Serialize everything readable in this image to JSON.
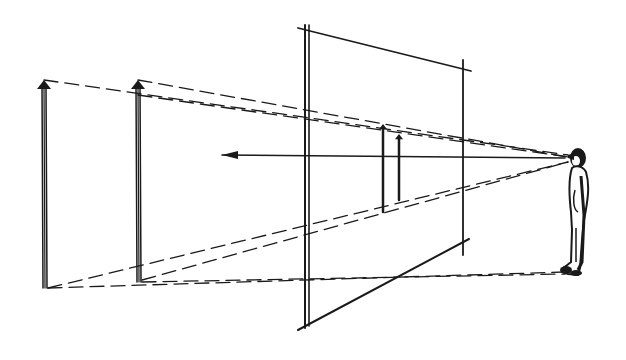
{
  "diagram": {
    "colors": {
      "ink": "#1a1a1a",
      "background": "#ffffff"
    },
    "picture_plane": {
      "left_edge": [
        [
          305,
          25
        ],
        [
          305,
          328
        ]
      ],
      "left_edge_inner": [
        [
          309,
          25
        ],
        [
          309,
          326
        ]
      ],
      "top_edge": [
        [
          298,
          28
        ],
        [
          471,
          71
        ]
      ],
      "right_edge": [
        [
          463,
          60
        ],
        [
          463,
          255
        ]
      ],
      "bottom_edge": [
        [
          298,
          330
        ],
        [
          469,
          239
        ]
      ]
    },
    "observer": {
      "eye": [
        568,
        155
      ],
      "feet": [
        572,
        272
      ]
    },
    "poles": [
      {
        "x": 44,
        "top": 80,
        "bottom": 288
      },
      {
        "x": 138,
        "top": 80,
        "bottom": 282
      }
    ],
    "projected_poles": [
      {
        "x": 383,
        "top": 124,
        "bottom": 212
      },
      {
        "x": 399,
        "top": 134,
        "bottom": 200
      }
    ],
    "sight_line": {
      "from": [
        565,
        158
      ],
      "to": [
        222,
        155
      ]
    },
    "dashed_rays": [
      [
        [
          44,
          80
        ],
        [
          568,
          155
        ]
      ],
      [
        [
          138,
          80
        ],
        [
          568,
          157
        ]
      ],
      [
        [
          138,
          95
        ],
        [
          568,
          157
        ]
      ],
      [
        [
          48,
          288
        ],
        [
          568,
          162
        ]
      ],
      [
        [
          142,
          280
        ],
        [
          568,
          162
        ]
      ],
      [
        [
          48,
          288
        ],
        [
          565,
          272
        ]
      ],
      [
        [
          142,
          282
        ],
        [
          565,
          274
        ]
      ]
    ]
  }
}
